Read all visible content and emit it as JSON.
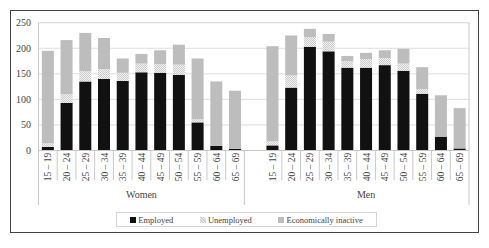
{
  "chart_data": {
    "type": "bar",
    "stacked": true,
    "title": "",
    "xlabel": "",
    "ylabel": "",
    "ylim": [
      0,
      250
    ],
    "yticks": [
      0,
      50,
      100,
      150,
      200,
      250
    ],
    "grid": true,
    "legend_position": "bottom",
    "groups": [
      "Women",
      "Men"
    ],
    "categories": [
      "15 – 19",
      "20 – 24",
      "25 – 29",
      "30 – 34",
      "35 – 39",
      "40 – 44",
      "45 – 49",
      "50 – 54",
      "55 – 59",
      "60 – 64",
      "65 – 69"
    ],
    "series": [
      {
        "name": "Employed",
        "color": "#111111",
        "values": {
          "Women": [
            7,
            93,
            135,
            140,
            136,
            153,
            152,
            148,
            55,
            9,
            3
          ],
          "Men": [
            10,
            123,
            203,
            194,
            162,
            162,
            167,
            156,
            111,
            27,
            4
          ]
        }
      },
      {
        "name": "Unemployed",
        "color": "#dcdcdc",
        "pattern": "checker",
        "values": {
          "Women": [
            7,
            17,
            20,
            19,
            16,
            17,
            17,
            20,
            6,
            0,
            0
          ],
          "Men": [
            8,
            24,
            19,
            19,
            13,
            17,
            14,
            14,
            9,
            0,
            0
          ]
        }
      },
      {
        "name": "Economically inactive",
        "color": "#bdbdbd",
        "values": {
          "Women": [
            181,
            106,
            75,
            61,
            28,
            19,
            27,
            39,
            119,
            126,
            114
          ],
          "Men": [
            186,
            78,
            16,
            15,
            10,
            12,
            15,
            29,
            43,
            81,
            79
          ]
        }
      }
    ]
  },
  "legend": {
    "items": [
      {
        "label": "Employed",
        "key": "employed"
      },
      {
        "label": "Unemployed",
        "key": "unemployed"
      },
      {
        "label": "Economically inactive",
        "key": "inactive"
      }
    ]
  },
  "colors": {
    "employed": "#111111",
    "unemployed_a": "#cfcfcf",
    "unemployed_b": "#f4f4f4",
    "inactive": "#bdbdbd",
    "grid": "#dedede",
    "axis": "#c8c8c8",
    "text": "#444444",
    "frame": "#444444"
  }
}
